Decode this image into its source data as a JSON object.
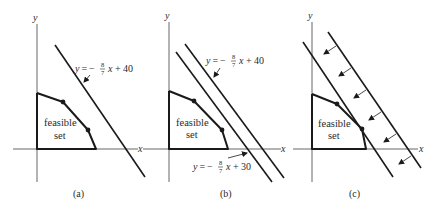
{
  "figure": {
    "panels": [
      {
        "id": "a",
        "caption": "(a)",
        "axis_x_label": "x",
        "axis_y_label": "y",
        "region_label_line1": "feasible",
        "region_label_line2": "set",
        "lines": [
          {
            "label_prefix": "y = −",
            "frac_num": "8",
            "frac_den": "7",
            "label_suffix": " x + 40"
          }
        ]
      },
      {
        "id": "b",
        "caption": "(b)",
        "axis_x_label": "x",
        "axis_y_label": "y",
        "region_label_line1": "feasible",
        "region_label_line2": "set",
        "lines": [
          {
            "label_prefix": "y = −",
            "frac_num": "8",
            "frac_den": "7",
            "label_suffix": " x + 40"
          },
          {
            "label_prefix": "y = −",
            "frac_num": "8",
            "frac_den": "7",
            "label_suffix": " x + 30"
          }
        ]
      },
      {
        "id": "c",
        "caption": "(c)",
        "axis_x_label": "x",
        "axis_y_label": "y",
        "region_label_line1": "feasible",
        "region_label_line2": "set",
        "arrow_count": 6
      }
    ],
    "colors": {
      "stroke": "#1a1a1a",
      "axis": "#555555",
      "text": "#2a2a2a",
      "background": "#ffffff"
    }
  }
}
